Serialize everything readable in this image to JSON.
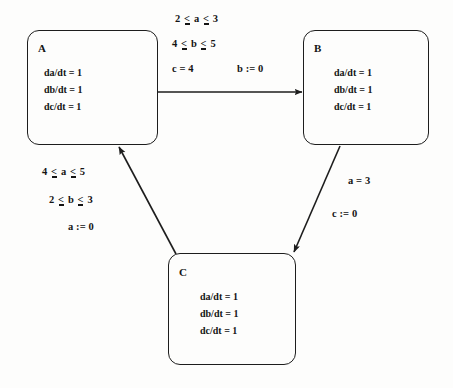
{
  "diagram": {
    "type": "hybrid-automaton-state-transition",
    "states": [
      {
        "id": "A",
        "label": "A",
        "flows": [
          "da/dt = 1",
          "db/dt = 1",
          "dc/dt = 1"
        ]
      },
      {
        "id": "B",
        "label": "B",
        "flows": [
          "da/dt = 1",
          "db/dt = 1",
          "dc/dt = 1"
        ]
      },
      {
        "id": "C",
        "label": "C",
        "flows": [
          "da/dt = 1",
          "db/dt = 1",
          "dc/dt = 1"
        ]
      }
    ],
    "transitions": [
      {
        "id": "a-to-b",
        "from": "A",
        "to": "B",
        "guards": [
          "2 < a < 3",
          "4 < b < 5",
          "c = 4"
        ],
        "guard_lines": [
          {
            "left": "2",
            "op1": "<",
            "var": "a",
            "op2": "<",
            "right": "3"
          },
          {
            "left": "4",
            "op1": "<",
            "var": "b",
            "op2": "<",
            "right": "5"
          }
        ],
        "guard_plain": "c = 4",
        "action": "b := 0"
      },
      {
        "id": "b-to-c",
        "from": "B",
        "to": "C",
        "guards": [
          "a = 3"
        ],
        "guard_plain": "a = 3",
        "action": "c := 0"
      },
      {
        "id": "c-to-a",
        "from": "C",
        "to": "A",
        "guards": [
          "4 < a < 5",
          "2 < b < 3"
        ],
        "guard_lines": [
          {
            "left": "4",
            "op1": "<",
            "var": "a",
            "op2": "<",
            "right": "5"
          },
          {
            "left": "2",
            "op1": "<",
            "var": "b",
            "op2": "<",
            "right": "3"
          }
        ],
        "action": "a := 0"
      }
    ],
    "colors": {
      "stroke": "#1d1d1d",
      "text": "#141414",
      "background": "#fdfdfc"
    }
  }
}
